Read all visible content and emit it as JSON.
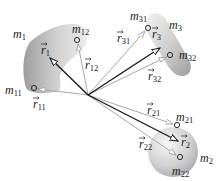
{
  "diagram": {
    "origin": {
      "x": 88,
      "y": 95
    },
    "bodies": [
      {
        "id": "m1",
        "label": "m",
        "sub": "1",
        "label_pos": [
          13,
          38
        ],
        "points": [
          {
            "id": "m11",
            "label": "m",
            "sub": "11",
            "pos": [
              34,
              88
            ],
            "label_pos": [
              5,
              94
            ],
            "vector": "r",
            "vsub": "11",
            "vlabel_pos": [
              38,
              108
            ]
          },
          {
            "id": "m12",
            "label": "m",
            "sub": "12",
            "pos": [
              77,
              40
            ],
            "label_pos": [
              72,
              33
            ],
            "vector": "r",
            "vsub": "12",
            "vlabel_pos": [
              86,
              67
            ]
          }
        ],
        "cm_vector": {
          "label": "r",
          "sub": "1",
          "tip": [
            50,
            58
          ],
          "label_pos": [
            41,
            54
          ]
        }
      },
      {
        "id": "m2",
        "label": "m",
        "sub": "2",
        "label_pos": [
          200,
          162
        ],
        "points": [
          {
            "id": "m21",
            "label": "m",
            "sub": "21",
            "pos": [
              177,
              125
            ],
            "label_pos": [
              176,
              121
            ],
            "vector": "r",
            "vsub": "21",
            "vlabel_pos": [
              146,
              112
            ]
          },
          {
            "id": "m22",
            "label": "m",
            "sub": "22",
            "pos": [
              180,
              157
            ],
            "label_pos": [
              172,
              175
            ],
            "vector": "r",
            "vsub": "22",
            "vlabel_pos": [
              139,
              148
            ]
          }
        ],
        "cm_vector": {
          "label": "r",
          "sub": "2",
          "tip": [
            177,
            141
          ],
          "label_pos": [
            181,
            142
          ]
        }
      },
      {
        "id": "m3",
        "label": "m",
        "sub": "3",
        "label_pos": [
          169,
          29
        ],
        "points": [
          {
            "id": "m31",
            "label": "m",
            "sub": "31",
            "pos": [
              148,
              28
            ],
            "label_pos": [
              130,
              20
            ],
            "vector": "r",
            "vsub": "31",
            "vlabel_pos": [
              119,
              39
            ]
          },
          {
            "id": "m32",
            "label": "m",
            "sub": "32",
            "pos": [
              170,
              55
            ],
            "label_pos": [
              179,
              59
            ],
            "vector": "r",
            "vsub": "32",
            "vlabel_pos": [
              148,
              78
            ]
          }
        ],
        "cm_vector": {
          "label": "r",
          "sub": "3",
          "tip": [
            160,
            48
          ],
          "label_pos": [
            152,
            38
          ]
        }
      }
    ],
    "colors": {
      "main_vector": "#1a1a1a",
      "point_vector": "#a8a8a8",
      "body_fill_light": "#ededed",
      "body_fill_dark": "#9a9a9a"
    }
  }
}
